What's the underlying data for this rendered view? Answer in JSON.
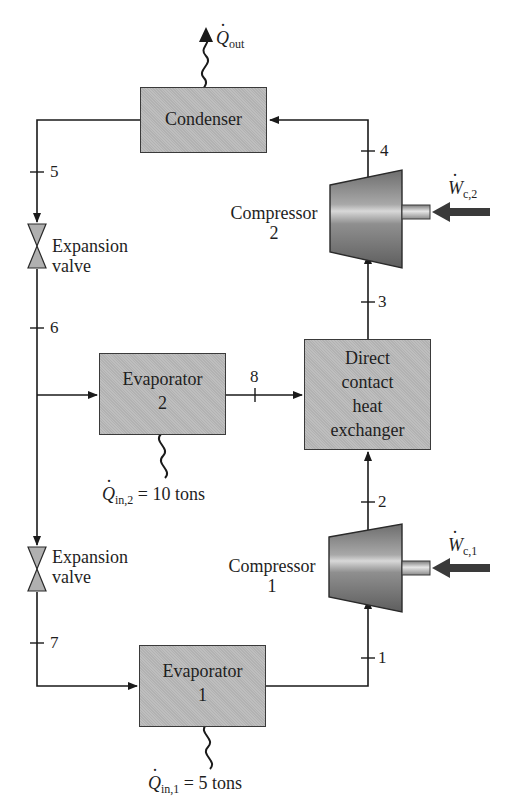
{
  "components": {
    "condenser": {
      "label": "Condenser"
    },
    "compressor_2": {
      "line1": "Compressor",
      "line2": "2"
    },
    "compressor_1": {
      "line1": "Compressor",
      "line2": "1"
    },
    "expansion_valve_1": {
      "line1": "Expansion",
      "line2": "valve"
    },
    "expansion_valve_2": {
      "line1": "Expansion",
      "line2": "valve"
    },
    "evaporator_2": {
      "line1": "Evaporator",
      "line2": "2"
    },
    "evaporator_1": {
      "line1": "Evaporator",
      "line2": "1"
    },
    "direct_contact_hx": {
      "line1": "Direct",
      "line2": "contact",
      "line3": "heat",
      "line4": "exchanger"
    }
  },
  "heat_work": {
    "q_out": {
      "symbol": "Q",
      "sub": "out"
    },
    "w_c2": {
      "symbol": "W",
      "sub": "c,2"
    },
    "w_c1": {
      "symbol": "W",
      "sub": "c,1"
    },
    "q_in2": {
      "symbol": "Q",
      "sub": "in,2",
      "value": "= 10 tons"
    },
    "q_in1": {
      "symbol": "Q",
      "sub": "in,1",
      "value": "= 5 tons"
    }
  },
  "state_points": [
    "1",
    "2",
    "3",
    "4",
    "5",
    "6",
    "7",
    "8"
  ],
  "colors": {
    "line": "#1a1a1a",
    "box_fill": "#b9b9b9",
    "compressor_fill": "#8a8a8a",
    "valve_fill": "#b0b0b0",
    "work_arrow": "#3a3a3a"
  }
}
